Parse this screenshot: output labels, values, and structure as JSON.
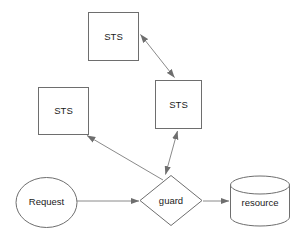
{
  "diagram": {
    "background_color": "#ffffff",
    "stroke_color": "#6e6e6e",
    "edge_color": "#8a8a8a",
    "text_color": "#1a1a1a",
    "nodes": {
      "sts_top": {
        "label": "STS",
        "shape": "rectangle",
        "x": 88,
        "y": 12,
        "width": 50,
        "height": 48
      },
      "sts_middle": {
        "label": "STS",
        "shape": "rectangle",
        "x": 155,
        "y": 80,
        "width": 46,
        "height": 48
      },
      "sts_left": {
        "label": "STS",
        "shape": "rectangle",
        "x": 38,
        "y": 87,
        "width": 50,
        "height": 47
      },
      "request": {
        "label": "Request",
        "shape": "ellipse",
        "cx": 46,
        "cy": 203,
        "rx": 31,
        "ry": 25
      },
      "guard": {
        "label": "guard",
        "shape": "diamond",
        "cx": 171,
        "cy": 200,
        "rx": 31,
        "ry": 25
      },
      "resource": {
        "label": "resource",
        "shape": "cylinder",
        "x": 230,
        "y": 176,
        "width": 60,
        "height": 50
      }
    },
    "edges": [
      {
        "name": "sts-top-to-sts-middle",
        "from": "sts_top",
        "to": "sts_middle",
        "direction": "bidirectional"
      },
      {
        "name": "guard-to-sts-middle",
        "from": "guard",
        "to": "sts_middle",
        "direction": "bidirectional"
      },
      {
        "name": "guard-to-sts-left",
        "from": "guard",
        "to": "sts_left",
        "direction": "forward"
      },
      {
        "name": "request-to-guard",
        "from": "request",
        "to": "guard",
        "direction": "forward"
      },
      {
        "name": "guard-to-resource",
        "from": "guard",
        "to": "resource",
        "direction": "forward"
      }
    ]
  }
}
